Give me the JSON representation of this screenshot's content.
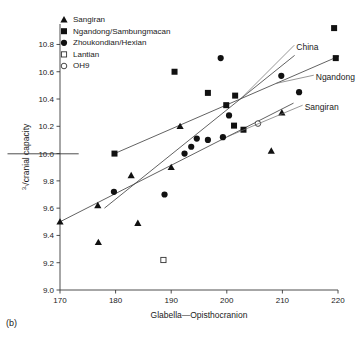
{
  "panel": {
    "label": "(b)"
  },
  "chart_data": {
    "type": "scatter",
    "title": "",
    "xlabel": "Glabella—Opisthocranion",
    "ylabel": "³√cranial capacity",
    "ylabel_parts": {
      "index": "3",
      "radical": "√",
      "text": "cranial capacity"
    },
    "xlim": [
      170,
      220
    ],
    "ylim": [
      9.0,
      10.95
    ],
    "xticks": [
      170,
      180,
      190,
      200,
      210,
      220
    ],
    "xtick_labels": [
      "170",
      "180",
      "190",
      "200",
      "210",
      "220"
    ],
    "yticks": [
      9.0,
      9.2,
      9.4,
      9.6,
      9.8,
      10.0,
      10.2,
      10.4,
      10.6,
      10.8
    ],
    "ytick_labels": [
      "9.0",
      "9.2",
      "9.4",
      "9.6",
      "9.8",
      "10.0",
      "10.2",
      "10.4",
      "10.6",
      "10.8"
    ],
    "grid": false,
    "legend_position": "top-left",
    "series": [
      {
        "name": "Sangiran",
        "marker": "filled-triangle",
        "color": "#111111",
        "points": [
          {
            "x": 170.0,
            "y": 9.5
          },
          {
            "x": 176.8,
            "y": 9.62
          },
          {
            "x": 176.9,
            "y": 9.35
          },
          {
            "x": 182.8,
            "y": 9.84
          },
          {
            "x": 184.0,
            "y": 9.49
          },
          {
            "x": 190.0,
            "y": 9.9
          },
          {
            "x": 191.6,
            "y": 10.2
          },
          {
            "x": 208.0,
            "y": 10.02
          },
          {
            "x": 209.9,
            "y": 10.3
          }
        ]
      },
      {
        "name": "Ngandong/Sambungmacan",
        "marker": "filled-square",
        "color": "#111111",
        "points": [
          {
            "x": 179.8,
            "y": 10.0
          },
          {
            "x": 190.6,
            "y": 10.6
          },
          {
            "x": 196.6,
            "y": 10.445
          },
          {
            "x": 199.9,
            "y": 10.355
          },
          {
            "x": 201.5,
            "y": 10.425
          },
          {
            "x": 201.3,
            "y": 10.205
          },
          {
            "x": 203.0,
            "y": 10.175
          },
          {
            "x": 219.3,
            "y": 10.92
          },
          {
            "x": 219.6,
            "y": 10.7
          }
        ]
      },
      {
        "name": "Zhoukondian/Hexian",
        "marker": "filled-circle",
        "color": "#111111",
        "points": [
          {
            "x": 179.7,
            "y": 9.72
          },
          {
            "x": 188.8,
            "y": 9.7
          },
          {
            "x": 192.4,
            "y": 10.0
          },
          {
            "x": 193.6,
            "y": 10.05
          },
          {
            "x": 194.6,
            "y": 10.11
          },
          {
            "x": 196.6,
            "y": 10.1
          },
          {
            "x": 198.9,
            "y": 10.7
          },
          {
            "x": 200.4,
            "y": 10.28
          },
          {
            "x": 199.3,
            "y": 10.12
          },
          {
            "x": 209.8,
            "y": 10.57
          },
          {
            "x": 213.0,
            "y": 10.45
          }
        ]
      },
      {
        "name": "Lantian",
        "marker": "open-square",
        "color": "#333333",
        "points": [
          {
            "x": 188.6,
            "y": 9.22
          }
        ]
      },
      {
        "name": "OH9",
        "marker": "open-circle",
        "color": "#333333",
        "points": [
          {
            "x": 205.6,
            "y": 10.22
          }
        ]
      }
    ],
    "trend_lines": [
      {
        "name": "China",
        "label": "China",
        "x1": 178.0,
        "y1": 9.6,
        "x2": 212.2,
        "y2": 10.72
      },
      {
        "name": "Ngandong",
        "label": "Ngandong",
        "x1": 179.8,
        "y1": 10.0,
        "x2": 220.2,
        "y2": 10.715
      },
      {
        "name": "Sangiran",
        "label": "Sangiran",
        "x1": 170.0,
        "y1": 9.5,
        "x2": 212.0,
        "y2": 10.37
      }
    ],
    "line_label_positions": [
      {
        "name": "China",
        "lx": 212.5,
        "ly": 10.78
      },
      {
        "name": "Ngandong",
        "lx": 216.0,
        "ly": 10.56
      },
      {
        "name": "Sangiran",
        "lx": 214.0,
        "ly": 10.34
      }
    ]
  },
  "legend": {
    "items": [
      {
        "label": "Sangiran",
        "marker": "filled-triangle"
      },
      {
        "label": "Ngandong/Sambungmacan",
        "marker": "filled-square"
      },
      {
        "label": "Zhoukondian/Hexian",
        "marker": "filled-circle"
      },
      {
        "label": "Lantian",
        "marker": "open-square"
      },
      {
        "label": "OH9",
        "marker": "open-circle"
      }
    ]
  }
}
